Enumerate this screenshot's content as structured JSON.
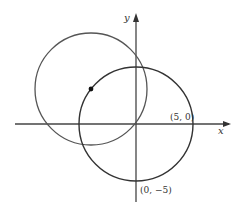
{
  "diagram": {
    "axes": {
      "x_label": "x",
      "y_label": "y",
      "color": "#333333"
    },
    "points": {
      "p1_label": "(5, 0)",
      "p2_label": "(0, −5)"
    },
    "circles": [
      {
        "name": "upper-left circle",
        "stroke": "#555555"
      },
      {
        "name": "origin-centered circle",
        "stroke": "#333333"
      }
    ],
    "center_dot": {
      "color": "#111111"
    }
  }
}
